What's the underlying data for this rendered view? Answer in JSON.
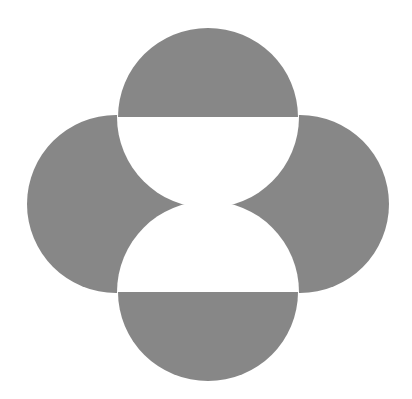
{
  "logo": {
    "name": "four-circle-emblem",
    "colors": {
      "shape": "#878787",
      "background": "#ffffff"
    },
    "geometry": {
      "top_circle": {
        "cx": 208,
        "cy": 117,
        "r": 89
      },
      "bottom_circle": {
        "cx": 208,
        "cy": 292,
        "r": 89
      },
      "left_circle": {
        "cx": 116,
        "cy": 204,
        "r": 89
      },
      "right_circle": {
        "cx": 300,
        "cy": 204,
        "r": 89
      }
    }
  }
}
